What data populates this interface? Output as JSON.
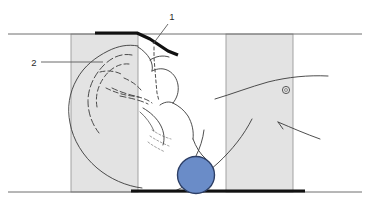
{
  "figure": {
    "background_color": "#ffffff",
    "width": 370,
    "height": 202
  },
  "colors": {
    "band_fill": "#e3e3e3",
    "band_stroke": "#9a9a9a",
    "outline": "#3a3a3a",
    "heavy_line": "#111111",
    "reference_line": "#6e6e6e",
    "leader_line": "#5a5a5a",
    "pad_fill": "#6a8cc8",
    "pad_stroke": "#2d3f66",
    "label_text": "#2b2b2b"
  },
  "callouts": [
    {
      "id": "callout-1",
      "label": "1",
      "label_x": 172,
      "label_y": 20,
      "leader": {
        "x1": 168,
        "y1": 24,
        "x2": 153,
        "y2": 44
      }
    },
    {
      "id": "callout-2",
      "label": "2",
      "label_x": 34,
      "label_y": 66,
      "leader": {
        "x1": 41,
        "y1": 62,
        "x2": 103,
        "y2": 62
      }
    }
  ],
  "bands": [
    {
      "id": "band-left",
      "x": 71,
      "y": 34,
      "width": 67,
      "height": 158
    },
    {
      "id": "band-right",
      "x": 226,
      "y": 34,
      "width": 67,
      "height": 158
    }
  ],
  "reference_lines": [
    {
      "id": "reference-line-top",
      "x1": 8,
      "y1": 34,
      "x2": 362,
      "y2": 34
    },
    {
      "id": "reference-line-bottom",
      "x1": 8,
      "y1": 192,
      "x2": 362,
      "y2": 192
    }
  ],
  "heavy_segments": [
    {
      "id": "heavy-top-plate",
      "points": "95,33 137,33 150,39 168,51 178,55"
    },
    {
      "id": "heavy-bottom-plate",
      "points": "131,191 305,191"
    }
  ],
  "pad": {
    "id": "support-pad",
    "cx": 196,
    "cy": 175,
    "r": 18.5
  },
  "marker": {
    "id": "ear-marker",
    "cx": 286,
    "cy": 90,
    "r": 3.6
  },
  "anatomy_paths": {
    "skull_outline": "M138,46 C128,44 118,46 108,51 C96,57 84,66 77,79 C69,93 67,108 70,123 C73,140 83,156 97,168 C110,179 126,186 142,188",
    "cranium_inner": "M132,55 C122,53 112,57 104,65 C94,75 88,88 88,101 C88,113 92,124 99,133",
    "cranium_inner2": "M129,64 C120,63 111,68 105,76 C98,85 95,96 97,107",
    "brow_ridge": "M138,47 C143,50 147,54 150,59 C152,63 153,67 152,71",
    "face_profile": "M152,71 C158,68 164,68 169,71 C174,74 177,79 178,85 C179,92 177,98 173,103",
    "nose_bridge": "M150,60 C156,56 163,55 169,57",
    "jaw_line": "M173,103 C179,106 184,110 188,116 C192,123 194,131 193,139",
    "neck_front": "M193,139 C196,147 200,154 206,159",
    "chin_shade": "M160,105 C164,102 169,101 173,103",
    "mouth_curve": "M143,108 C150,112 157,118 161,126 C164,132 165,139 163,145",
    "inner_mouth": "M140,112 C146,117 151,124 154,131",
    "cheek_line": "M120,96 C130,98 140,100 148,104",
    "cheek_line2": "M112,88 C120,92 130,95 139,97",
    "temple_line": "M124,78 C131,81 137,85 141,90",
    "shoulder_curve": "M215,99 C232,94 250,87 268,82 C288,77 308,75 328,76",
    "trunk_curve": "M175,191 C190,184 205,175 218,163 C232,150 244,135 252,119",
    "back_curve": "M196,156 C200,148 203,139 204,130",
    "arm_line": "M278,122 C292,128 306,134 320,139",
    "arm_tick": "M278,122 L283,129",
    "neck_back": "M205,160 C198,166 190,171 182,174",
    "dash_vertical": "M154,47 L154,58 L155,70 L156,82 L157,93 L159,101",
    "dash_jaw": "M106,88 C114,92 123,95 132,96 C140,97 147,99 152,103",
    "dash_skull": "M100,72 C108,70 116,71 123,75",
    "hair_strands": "M152,130 C158,134 164,137 171,139 M150,136 C156,140 162,143 169,146 M148,142 C153,146 159,149 165,152"
  }
}
